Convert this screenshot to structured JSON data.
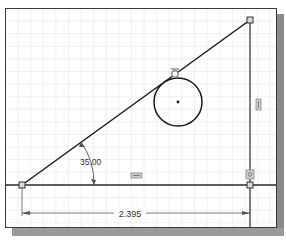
{
  "sketch": {
    "angle_dimension": {
      "label": "35.00",
      "x": 80,
      "y": 165
    },
    "linear_dimension": {
      "label": "2.395",
      "x": 130,
      "y": 217
    },
    "colors": {
      "grid": "#e4e4e4",
      "geometry": "#1a1a1a",
      "dimension": "#555555",
      "constraint_glyph": "#9a9a9a",
      "shadow": "#8a8a8a",
      "frame": "#3a3a3a"
    },
    "constraints": [
      {
        "name": "tangent-constraint-icon",
        "x": 175,
        "y": 73
      },
      {
        "name": "vertical-constraint-icon",
        "x": 258,
        "y": 105
      },
      {
        "name": "horizontal-constraint-icon",
        "x": 137,
        "y": 176
      },
      {
        "name": "coincident-constraint-icon",
        "x": 250,
        "y": 175
      }
    ]
  }
}
